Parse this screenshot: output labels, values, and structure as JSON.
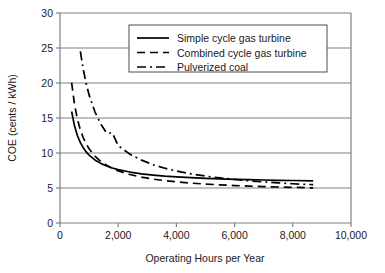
{
  "chart_data": {
    "type": "line",
    "title": "",
    "xlabel": "Operating Hours per Year",
    "ylabel": "COE (cents / kWh)",
    "xlim": [
      0,
      10000
    ],
    "ylim": [
      0,
      30
    ],
    "xticks": [
      0,
      2000,
      4000,
      6000,
      8000,
      10000
    ],
    "xtick_labels": [
      "0",
      "2,000",
      "4,000",
      "6,000",
      "8,000",
      "10,000"
    ],
    "yticks": [
      0,
      5,
      10,
      15,
      20,
      25,
      30
    ],
    "ytick_labels": [
      "0",
      "5",
      "10",
      "15",
      "20",
      "25",
      "30"
    ],
    "grid": "horizontal",
    "legend_position": "upper-right-inside",
    "series": [
      {
        "name": "Simple cycle gas turbine",
        "style": "solid",
        "color": "#000000",
        "model": "COE = 5.55 + 4150 / hours",
        "x": [
          400,
          500,
          600,
          700,
          800,
          900,
          1000,
          1200,
          1400,
          1600,
          1800,
          2000,
          2400,
          2800,
          3200,
          3600,
          4000,
          4500,
          5000,
          5500,
          6000,
          6500,
          7000,
          7500,
          8000,
          8700
        ],
        "y": [
          15.93,
          13.85,
          12.47,
          11.48,
          10.74,
          10.16,
          9.7,
          9.01,
          8.52,
          8.14,
          7.86,
          7.63,
          7.28,
          7.03,
          6.85,
          6.7,
          6.59,
          6.47,
          6.38,
          6.3,
          6.24,
          6.19,
          6.14,
          6.1,
          6.07,
          6.03
        ]
      },
      {
        "name": "Combined cycle gas turbine",
        "style": "dashed",
        "color": "#000000",
        "model": "COE = 4.30 + 6300 / hours",
        "x": [
          400,
          500,
          600,
          700,
          800,
          900,
          1000,
          1200,
          1400,
          1600,
          1800,
          2000,
          2400,
          2800,
          3200,
          3600,
          4000,
          4500,
          5000,
          5500,
          6000,
          6500,
          7000,
          7500,
          8000,
          8700
        ],
        "y": [
          20.05,
          16.9,
          14.8,
          13.3,
          12.18,
          11.3,
          10.6,
          9.55,
          8.8,
          8.24,
          7.8,
          7.45,
          6.93,
          6.55,
          6.27,
          6.05,
          5.88,
          5.7,
          5.56,
          5.45,
          5.35,
          5.27,
          5.2,
          5.14,
          5.09,
          5.02
        ]
      },
      {
        "name": "Pulverized coal",
        "style": "dash-dot",
        "color": "#000000",
        "model": "COE = 3.80 + 14500 / hours",
        "x": [
          700,
          800,
          900,
          1000,
          1200,
          1400,
          1600,
          1800,
          2000,
          2400,
          2800,
          3200,
          3600,
          4000,
          4500,
          5000,
          5500,
          6000,
          6500,
          7000,
          7500,
          8000,
          8700
        ],
        "y": [
          24.51,
          21.93,
          19.91,
          18.3,
          15.88,
          14.16,
          12.86,
          12.86,
          11.05,
          9.84,
          8.98,
          8.33,
          7.83,
          7.43,
          7.02,
          6.7,
          6.44,
          6.22,
          6.03,
          5.87,
          5.73,
          5.61,
          5.47
        ]
      }
    ]
  },
  "legend": {
    "items": [
      {
        "label": "Simple cycle gas turbine",
        "style": "solid"
      },
      {
        "label": "Combined cycle gas turbine",
        "style": "dashed"
      },
      {
        "label": "Pulverized coal",
        "style": "dash-dot"
      }
    ]
  },
  "colors": {
    "line": "#000000",
    "grid": "#808080",
    "axis": "#808080",
    "background": "#ffffff",
    "text": "#1a1a1a"
  }
}
